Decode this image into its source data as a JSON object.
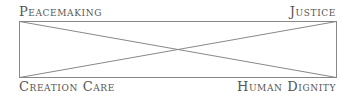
{
  "diagram": {
    "type": "square-with-crossed-diagonals",
    "corners": {
      "top_left": "Peacemaking",
      "top_right": "Justice",
      "bottom_left": "Creation Care",
      "bottom_right": "Human Dignity"
    },
    "line_color": "#888888",
    "text_color": "#555555"
  }
}
